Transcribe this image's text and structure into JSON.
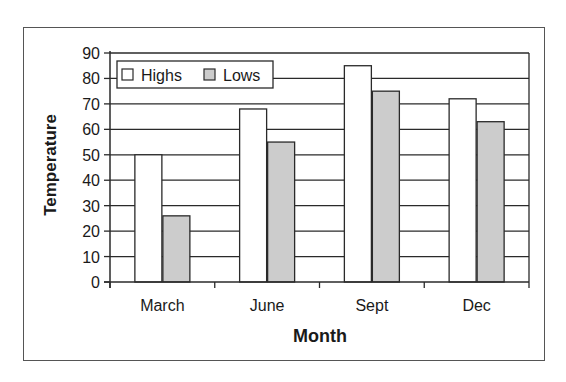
{
  "chart_data": {
    "type": "bar",
    "title": "",
    "xlabel": "Month",
    "ylabel": "Temperature",
    "categories": [
      "March",
      "June",
      "Sept",
      "Dec"
    ],
    "series": [
      {
        "name": "Highs",
        "values": [
          50,
          68,
          85,
          72
        ],
        "color": "#ffffff"
      },
      {
        "name": "Lows",
        "values": [
          26,
          55,
          75,
          63
        ],
        "color": "#cccccc"
      }
    ],
    "ylim": [
      0,
      90
    ],
    "yticks": [
      0,
      10,
      20,
      30,
      40,
      50,
      60,
      70,
      80,
      90
    ],
    "grid": true,
    "legend_position": "top-left-inside"
  }
}
